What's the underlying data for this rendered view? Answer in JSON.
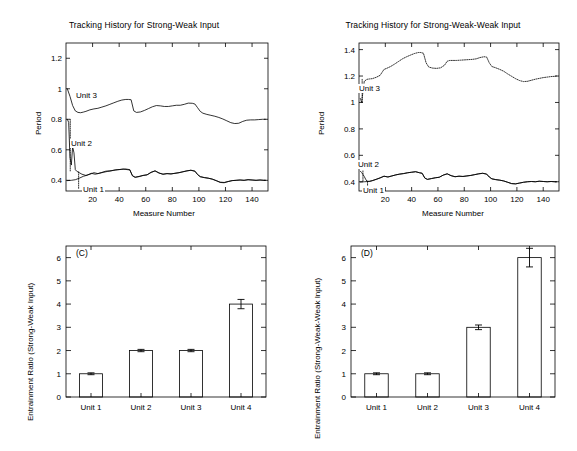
{
  "figure": {
    "panels": [
      "A-top-left",
      "B-top-right",
      "C-bottom-left",
      "D-bottom-right"
    ]
  },
  "panelA": {
    "title": "Tracking History for Strong-Weak Input",
    "xlabel": "Measure Number",
    "ylabel": "Period",
    "labels": {
      "unit1": "Unit 1",
      "unit2": "Unit 2",
      "unit3": "Unit 3"
    }
  },
  "panelB": {
    "title": "Tracking History for Strong-Weak-Weak Input",
    "xlabel": "Measure Number",
    "ylabel": "Period",
    "labels": {
      "unit1": "Unit 1",
      "unit2": "Unit 2",
      "unit3": "Unit 3"
    }
  },
  "panelC": {
    "id": "(C)",
    "ylabel": "Entrainment Ratio (Strong-Weak Input)"
  },
  "panelD": {
    "id": "(D)",
    "ylabel": "Entrainment Ratio (Strong-Weak-Weak Input)"
  },
  "chart_data": [
    {
      "panel": "A",
      "type": "line",
      "title": "Tracking History for Strong-Weak Input",
      "xlabel": "Measure Number",
      "ylabel": "Period",
      "xlim": [
        0,
        152
      ],
      "ylim": [
        0.33,
        1.3
      ],
      "xticks": [
        20,
        40,
        60,
        80,
        100,
        120,
        140
      ],
      "yticks": [
        0.4,
        0.6,
        0.8,
        1,
        1.2
      ],
      "grid": false,
      "legend": "inline-annotations",
      "annotations": [
        "Unit 3",
        "Unit 2",
        "Unit 1"
      ],
      "series": [
        {
          "name": "Unit 3",
          "style": "solid",
          "x": [
            1,
            3,
            5,
            7,
            9,
            11,
            13,
            15,
            18,
            21,
            24,
            27,
            30,
            33,
            36,
            39,
            42,
            45,
            47,
            49,
            51,
            53,
            56,
            59,
            62,
            65,
            68,
            71,
            74,
            77,
            80,
            83,
            86,
            89,
            92,
            95,
            97,
            99,
            101,
            103,
            106,
            109,
            112,
            115,
            118,
            121,
            124,
            127,
            130,
            133,
            136,
            139,
            142,
            145,
            148,
            150
          ],
          "y": [
            1.0,
            0.95,
            0.89,
            0.855,
            0.845,
            0.843,
            0.847,
            0.852,
            0.862,
            0.868,
            0.872,
            0.88,
            0.888,
            0.898,
            0.908,
            0.918,
            0.926,
            0.93,
            0.93,
            0.928,
            0.855,
            0.845,
            0.848,
            0.858,
            0.87,
            0.882,
            0.89,
            0.888,
            0.884,
            0.884,
            0.888,
            0.892,
            0.892,
            0.898,
            0.906,
            0.905,
            0.9,
            0.876,
            0.852,
            0.84,
            0.832,
            0.826,
            0.82,
            0.812,
            0.802,
            0.79,
            0.778,
            0.772,
            0.774,
            0.786,
            0.794,
            0.796,
            0.796,
            0.798,
            0.8,
            0.8
          ]
        },
        {
          "name": "Unit 2",
          "style": "dotted-transient-then-overlaps-unit1",
          "x": [
            1,
            2,
            3,
            4,
            5,
            6,
            7,
            8,
            9,
            10,
            12,
            15,
            18,
            21,
            24,
            27,
            30,
            33,
            36,
            39,
            42,
            45,
            48,
            50,
            52,
            55,
            58,
            61,
            64,
            67,
            70,
            73,
            76,
            79,
            82,
            85,
            88,
            91,
            94,
            97,
            99,
            101,
            104,
            107,
            110,
            113,
            116,
            119,
            122,
            125,
            128,
            131,
            134,
            137,
            140,
            143,
            146,
            149,
            150
          ],
          "y": [
            0.8,
            0.78,
            0.55,
            0.5,
            0.62,
            0.58,
            0.47,
            0.46,
            0.455,
            0.45,
            0.44,
            0.432,
            0.44,
            0.45,
            0.444,
            0.452,
            0.46,
            0.462,
            0.466,
            0.47,
            0.472,
            0.474,
            0.47,
            0.43,
            0.42,
            0.424,
            0.432,
            0.436,
            0.452,
            0.462,
            0.448,
            0.44,
            0.444,
            0.442,
            0.446,
            0.45,
            0.456,
            0.462,
            0.466,
            0.46,
            0.438,
            0.424,
            0.418,
            0.414,
            0.408,
            0.398,
            0.386,
            0.384,
            0.392,
            0.398,
            0.4,
            0.402,
            0.4,
            0.404,
            0.402,
            0.4,
            0.402,
            0.4,
            0.4
          ]
        },
        {
          "name": "Unit 1",
          "style": "solid",
          "x": [
            1,
            4,
            7,
            10,
            13,
            16,
            19,
            22,
            25,
            28,
            31,
            34,
            37,
            40,
            43,
            46,
            48,
            50,
            52,
            55,
            58,
            61,
            64,
            67,
            70,
            73,
            76,
            79,
            82,
            85,
            88,
            91,
            94,
            97,
            99,
            101,
            104,
            107,
            110,
            113,
            116,
            119,
            122,
            125,
            128,
            131,
            134,
            137,
            140,
            143,
            146,
            149,
            150
          ],
          "y": [
            0.398,
            0.4,
            0.404,
            0.414,
            0.426,
            0.434,
            0.446,
            0.44,
            0.446,
            0.452,
            0.458,
            0.462,
            0.468,
            0.47,
            0.474,
            0.47,
            0.468,
            0.43,
            0.42,
            0.426,
            0.432,
            0.436,
            0.452,
            0.462,
            0.448,
            0.44,
            0.444,
            0.442,
            0.446,
            0.45,
            0.456,
            0.462,
            0.466,
            0.46,
            0.438,
            0.424,
            0.418,
            0.414,
            0.408,
            0.398,
            0.388,
            0.386,
            0.392,
            0.398,
            0.4,
            0.402,
            0.4,
            0.404,
            0.402,
            0.4,
            0.402,
            0.4,
            0.4
          ]
        }
      ]
    },
    {
      "panel": "B",
      "type": "line",
      "title": "Tracking History for Strong-Weak-Weak Input",
      "xlabel": "Measure Number",
      "ylabel": "Period",
      "xlim": [
        0,
        152
      ],
      "ylim": [
        0.33,
        1.45
      ],
      "xticks": [
        20,
        40,
        60,
        80,
        100,
        120,
        140
      ],
      "yticks": [
        0.4,
        0.6,
        0.8,
        1,
        1.2,
        1.4
      ],
      "grid": false,
      "legend": "inline-annotations",
      "annotations": [
        "Unit 3",
        "Unit 2",
        "Unit 1"
      ],
      "series": [
        {
          "name": "Unit 3",
          "style": "dotted",
          "x": [
            1,
            2,
            3,
            4,
            6,
            8,
            10,
            13,
            16,
            19,
            21,
            24,
            27,
            30,
            33,
            36,
            39,
            42,
            45,
            47,
            49,
            51,
            53,
            56,
            59,
            62,
            65,
            67,
            69,
            71,
            74,
            77,
            80,
            83,
            86,
            89,
            92,
            95,
            97,
            99,
            101,
            104,
            107,
            110,
            113,
            116,
            119,
            122,
            125,
            128,
            131,
            134,
            137,
            140,
            143,
            146,
            149,
            150
          ],
          "y": [
            1.03,
            1.0,
            1.08,
            1.16,
            1.175,
            1.178,
            1.18,
            1.19,
            1.205,
            1.25,
            1.258,
            1.272,
            1.29,
            1.31,
            1.33,
            1.345,
            1.358,
            1.37,
            1.378,
            1.378,
            1.372,
            1.3,
            1.268,
            1.26,
            1.258,
            1.262,
            1.282,
            1.312,
            1.318,
            1.318,
            1.318,
            1.32,
            1.322,
            1.324,
            1.326,
            1.33,
            1.34,
            1.346,
            1.344,
            1.3,
            1.272,
            1.262,
            1.25,
            1.236,
            1.216,
            1.198,
            1.18,
            1.166,
            1.158,
            1.16,
            1.168,
            1.176,
            1.182,
            1.188,
            1.192,
            1.196,
            1.198,
            1.2
          ]
        },
        {
          "name": "Unit 2",
          "style": "dotted-transient-then-overlaps-unit1",
          "x": [
            1,
            2,
            3,
            4,
            5,
            6,
            8,
            10,
            13,
            16,
            19,
            22,
            25,
            28,
            31,
            34,
            37,
            40,
            43,
            46,
            48,
            50,
            52,
            55,
            58,
            61,
            64,
            67,
            70,
            73,
            76,
            79,
            82,
            85,
            88,
            91,
            94,
            97,
            99,
            101,
            104,
            107,
            110,
            113,
            116,
            119,
            122,
            125,
            128,
            131,
            134,
            137,
            140,
            143,
            146,
            149,
            150
          ],
          "y": [
            0.48,
            0.47,
            0.455,
            0.44,
            0.42,
            0.405,
            0.402,
            0.408,
            0.418,
            0.43,
            0.442,
            0.436,
            0.444,
            0.452,
            0.458,
            0.462,
            0.468,
            0.472,
            0.476,
            0.468,
            0.464,
            0.428,
            0.418,
            0.424,
            0.43,
            0.434,
            0.45,
            0.46,
            0.446,
            0.438,
            0.442,
            0.44,
            0.444,
            0.448,
            0.454,
            0.46,
            0.464,
            0.458,
            0.436,
            0.422,
            0.416,
            0.412,
            0.406,
            0.396,
            0.386,
            0.384,
            0.39,
            0.396,
            0.4,
            0.402,
            0.4,
            0.404,
            0.402,
            0.4,
            0.402,
            0.4,
            0.4
          ]
        },
        {
          "name": "Unit 1",
          "style": "solid",
          "x": [
            1,
            4,
            7,
            10,
            13,
            16,
            19,
            22,
            25,
            28,
            31,
            34,
            37,
            40,
            43,
            46,
            48,
            50,
            52,
            55,
            58,
            61,
            64,
            67,
            70,
            73,
            76,
            79,
            82,
            85,
            88,
            91,
            94,
            97,
            99,
            101,
            104,
            107,
            110,
            113,
            116,
            119,
            122,
            125,
            128,
            131,
            134,
            137,
            140,
            143,
            146,
            149,
            150
          ],
          "y": [
            0.398,
            0.4,
            0.402,
            0.408,
            0.418,
            0.428,
            0.442,
            0.436,
            0.444,
            0.452,
            0.458,
            0.462,
            0.468,
            0.472,
            0.476,
            0.468,
            0.464,
            0.428,
            0.418,
            0.424,
            0.43,
            0.434,
            0.45,
            0.46,
            0.446,
            0.438,
            0.442,
            0.44,
            0.444,
            0.448,
            0.454,
            0.46,
            0.464,
            0.458,
            0.436,
            0.422,
            0.416,
            0.412,
            0.406,
            0.396,
            0.386,
            0.384,
            0.39,
            0.396,
            0.4,
            0.402,
            0.4,
            0.404,
            0.402,
            0.4,
            0.402,
            0.4,
            0.4
          ]
        }
      ]
    },
    {
      "panel": "C",
      "type": "bar",
      "title": "(C)",
      "xlabel": "",
      "ylabel": "Entrainment Ratio (Strong-Weak Input)",
      "categories": [
        "Unit 1",
        "Unit 2",
        "Unit 3",
        "Unit 4"
      ],
      "values": [
        1,
        2,
        2,
        4
      ],
      "errors": [
        0.04,
        0.05,
        0.05,
        0.2
      ],
      "ylim": [
        0,
        6.5
      ],
      "yticks": [
        0,
        1,
        2,
        3,
        4,
        5,
        6
      ],
      "grid": false
    },
    {
      "panel": "D",
      "type": "bar",
      "title": "(D)",
      "xlabel": "",
      "ylabel": "Entrainment Ratio (Strong-Weak-Weak Input)",
      "categories": [
        "Unit 1",
        "Unit 2",
        "Unit 3",
        "Unit 4"
      ],
      "values": [
        1,
        1,
        3,
        6
      ],
      "errors": [
        0.04,
        0.04,
        0.1,
        0.4
      ],
      "ylim": [
        0,
        6.5
      ],
      "yticks": [
        0,
        1,
        2,
        3,
        4,
        5,
        6
      ],
      "grid": false
    }
  ]
}
